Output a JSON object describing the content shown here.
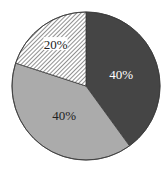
{
  "chart_data": {
    "type": "pie",
    "title": "",
    "categories": [
      "Dark segment",
      "Light gray segment",
      "Hatched segment"
    ],
    "values": [
      40,
      40,
      20
    ],
    "labels": [
      "40%",
      "40%",
      "20%"
    ],
    "start_angle_deg": 0,
    "direction": "clockwise",
    "legend": false,
    "slices": [
      {
        "value": 40,
        "label": "40%",
        "fill": "#454545",
        "pattern": "solid",
        "label_color": "#ffffff",
        "label_bg": null
      },
      {
        "value": 40,
        "label": "40%",
        "fill": "#ababab",
        "pattern": "solid",
        "label_color": "#222222",
        "label_bg": null
      },
      {
        "value": 20,
        "label": "20%",
        "fill": "#ffffff",
        "pattern": "diagonal-hatch",
        "hatch_color": "#555555",
        "label_color": "#222222",
        "label_bg": "#ffffff"
      }
    ]
  },
  "geometry": {
    "cx": 86,
    "cy": 86,
    "r": 74
  },
  "colors": {
    "outline": "#3a3a3a",
    "background": "#ffffff"
  }
}
